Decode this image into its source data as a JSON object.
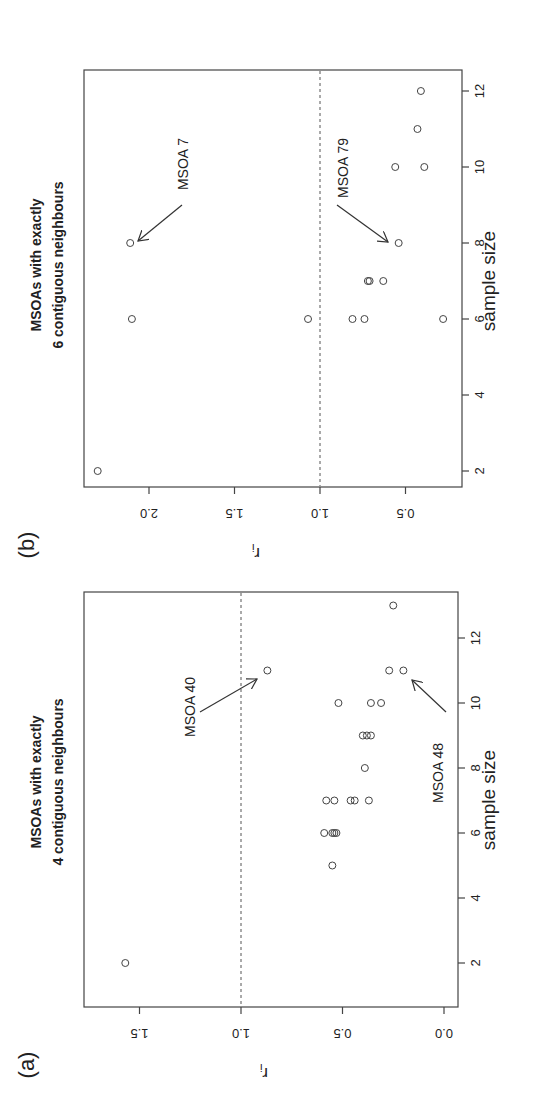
{
  "figure": {
    "orientation": "rotated 90 degrees clockwise",
    "panels": [
      {
        "id": "a",
        "label": "(a)",
        "title_line1": "MSOAs with exactly",
        "title_line2": "4 contiguous neighbours",
        "xlabel": "sample size",
        "ylabel": "r",
        "ylabel_sub": "i"
      },
      {
        "id": "b",
        "label": "(b)",
        "title_line1": "MSOAs with exactly",
        "title_line2": "6 contiguous neighbours",
        "xlabel": "sample size",
        "ylabel": "r",
        "ylabel_sub": "i"
      }
    ]
  },
  "chart_data": [
    {
      "panel": "(a)",
      "type": "scatter",
      "title": "MSOAs with exactly 4 contiguous neighbours",
      "xlabel": "sample size",
      "ylabel": "r_i",
      "xticks": [
        2,
        4,
        6,
        8,
        10,
        12
      ],
      "yticks": [
        0.0,
        0.5,
        1.0,
        1.5
      ],
      "ytick_labels": [
        "0.0",
        "0.5",
        "1.0",
        "1.5"
      ],
      "xlim": [
        1.5,
        13.5
      ],
      "ylim": [
        -0.05,
        1.75
      ],
      "reference_line": {
        "y": 1.0,
        "style": "dashed"
      },
      "grid": false,
      "points": [
        {
          "x": 2,
          "y": 1.57
        },
        {
          "x": 5,
          "y": 0.55
        },
        {
          "x": 6,
          "y": 0.59
        },
        {
          "x": 6,
          "y": 0.55
        },
        {
          "x": 6,
          "y": 0.54
        },
        {
          "x": 6,
          "y": 0.53
        },
        {
          "x": 7,
          "y": 0.58
        },
        {
          "x": 7,
          "y": 0.54
        },
        {
          "x": 7,
          "y": 0.46
        },
        {
          "x": 7,
          "y": 0.44
        },
        {
          "x": 7,
          "y": 0.37
        },
        {
          "x": 8,
          "y": 0.39
        },
        {
          "x": 9,
          "y": 0.4
        },
        {
          "x": 9,
          "y": 0.38
        },
        {
          "x": 9,
          "y": 0.36
        },
        {
          "x": 10,
          "y": 0.52
        },
        {
          "x": 10,
          "y": 0.36
        },
        {
          "x": 10,
          "y": 0.31
        },
        {
          "x": 11,
          "y": 0.87
        },
        {
          "x": 11,
          "y": 0.27
        },
        {
          "x": 11,
          "y": 0.2
        },
        {
          "x": 13,
          "y": 0.25
        }
      ],
      "annotations": [
        {
          "text": "MSOA 40",
          "x": 11,
          "y": 0.87
        },
        {
          "text": "MSOA 48",
          "x": 11,
          "y": 0.2
        }
      ]
    },
    {
      "panel": "(b)",
      "type": "scatter",
      "title": "MSOAs with exactly 6 contiguous neighbours",
      "xlabel": "sample size",
      "ylabel": "r_i",
      "xticks": [
        2,
        4,
        6,
        8,
        10,
        12
      ],
      "yticks": [
        0.5,
        1.0,
        1.5,
        2.0
      ],
      "ytick_labels": [
        "0.5",
        "1.0",
        "1.5",
        "2.0"
      ],
      "xlim": [
        1.6,
        12.5
      ],
      "ylim": [
        0.23,
        2.38
      ],
      "reference_line": {
        "y": 1.0,
        "style": "dashed"
      },
      "grid": false,
      "points": [
        {
          "x": 2,
          "y": 2.3
        },
        {
          "x": 6,
          "y": 2.1
        },
        {
          "x": 6,
          "y": 1.07
        },
        {
          "x": 6,
          "y": 0.81
        },
        {
          "x": 6,
          "y": 0.74
        },
        {
          "x": 6,
          "y": 0.28
        },
        {
          "x": 7,
          "y": 0.72
        },
        {
          "x": 7,
          "y": 0.71
        },
        {
          "x": 7,
          "y": 0.63
        },
        {
          "x": 8,
          "y": 2.11
        },
        {
          "x": 8,
          "y": 0.54
        },
        {
          "x": 10,
          "y": 0.56
        },
        {
          "x": 10,
          "y": 0.39
        },
        {
          "x": 11,
          "y": 0.43
        },
        {
          "x": 12,
          "y": 0.41
        }
      ],
      "annotations": [
        {
          "text": "MSOA 7",
          "x": 8,
          "y": 2.11
        },
        {
          "text": "MSOA 79",
          "x": 8,
          "y": 0.54
        }
      ]
    }
  ]
}
